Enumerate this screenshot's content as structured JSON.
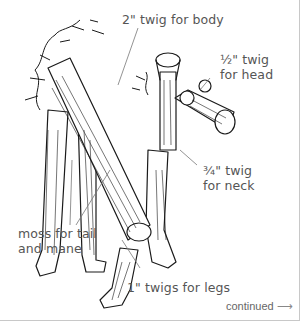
{
  "labels": {
    "body": "2\" twig for body",
    "head_line1": "½\" twig",
    "head_line2": "for head",
    "neck_line1": "¾\" twig",
    "neck_line2": "for neck",
    "moss_line1": "moss for tail",
    "moss_line2": "and mane",
    "legs": "1\" twigs for legs"
  },
  "footer": {
    "continued": "continued",
    "arrow": "⟶"
  },
  "colors": {
    "ink": "#1a1a1a",
    "label_text": "#555555",
    "leader_line": "#777777",
    "frame": "#c8c8c8"
  }
}
